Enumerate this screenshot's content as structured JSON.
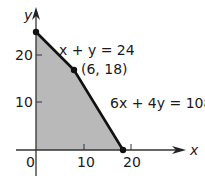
{
  "diagram": {
    "type": "feasible-region",
    "axes": {
      "x_label": "x",
      "y_label": "y",
      "origin_label": "0",
      "x_ticks": [
        {
          "value": 10,
          "label": "10"
        },
        {
          "value": 20,
          "label": "20"
        }
      ],
      "y_ticks": [
        {
          "value": 10,
          "label": "10"
        },
        {
          "value": 20,
          "label": "20"
        }
      ]
    },
    "vertices": [
      {
        "x": 0,
        "y": 24
      },
      {
        "x": 6,
        "y": 18,
        "label": "(6, 18)"
      },
      {
        "x": 18,
        "y": 0
      }
    ],
    "constraints": [
      {
        "equation": "x + y = 24"
      },
      {
        "equation": "6x + 4y = 108"
      }
    ],
    "colors": {
      "region_fill": "#b9b9b9",
      "boundary": "#111111",
      "axis": "#333333"
    }
  }
}
